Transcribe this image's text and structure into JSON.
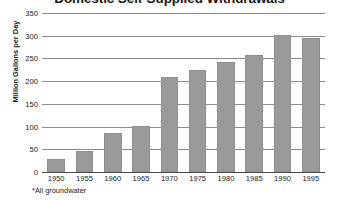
{
  "chart_data": {
    "type": "bar",
    "title": "Domestic Self-Supplied Withdrawals",
    "xlabel": "",
    "ylabel": "Million Gallons per Day",
    "categories": [
      "1950",
      "1955",
      "1960",
      "1965",
      "1970",
      "1975",
      "1980",
      "1985",
      "1990",
      "1995"
    ],
    "values": [
      28,
      46,
      85,
      101,
      210,
      225,
      242,
      258,
      302,
      295
    ],
    "ylim": [
      0,
      350
    ],
    "ytick_labels": [
      "0",
      "50",
      "100",
      "150",
      "200",
      "250",
      "300",
      "350"
    ],
    "ytick_values": [
      0,
      50,
      100,
      150,
      200,
      250,
      300,
      350
    ],
    "grid": true,
    "legend": false,
    "footnote": "*All groundwater",
    "bar_color": "#9a9a9a",
    "gridline_color": "#8c8c8c",
    "axis_color": "#4a4a4a",
    "background_color": "#ffffff",
    "text_color": "#1a1a1a"
  }
}
